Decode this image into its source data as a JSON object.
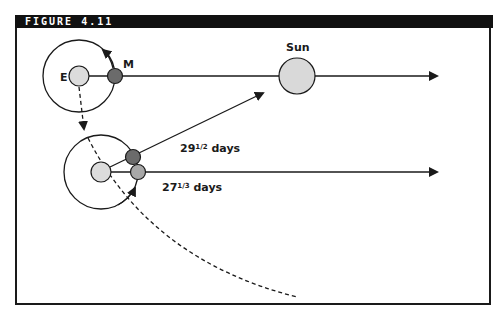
{
  "figure": {
    "label": "FIGURE 4.11"
  },
  "labels": {
    "earth": "E",
    "moon": "M",
    "sun": "Sun",
    "synodic_whole": "29",
    "synodic_frac": "1/2",
    "synodic_unit": " days",
    "sidereal_whole": "27",
    "sidereal_frac": "1/3",
    "sidereal_unit": " days"
  },
  "colors": {
    "line": "#1a1a1a",
    "earth_fill": "#dcdcdc",
    "sun_fill": "#d9d9d9",
    "moon_dark": "#6b6b6b",
    "moon_light": "#a8a8a8"
  }
}
